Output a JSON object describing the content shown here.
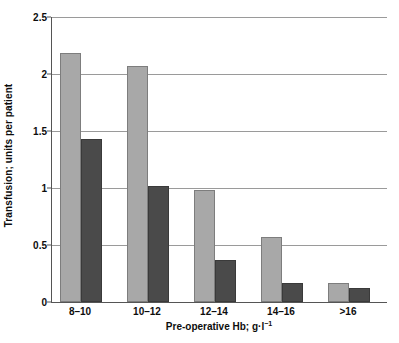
{
  "chart_data": {
    "type": "bar",
    "title": "",
    "subtitle": "",
    "xlabel": "Pre-operative Hb; g·l⁻¹",
    "ylabel": "Transfusion; units per patient",
    "categories": [
      "8–10",
      "10–12",
      "12–14",
      "14–16",
      ">16"
    ],
    "series": [
      {
        "name": "light-grey-series",
        "color": "#a8a8a8",
        "values": [
          2.18,
          2.07,
          0.98,
          0.57,
          0.17
        ]
      },
      {
        "name": "dark-grey-series",
        "color": "#4a4a4a",
        "values": [
          1.43,
          1.02,
          0.37,
          0.17,
          0.12
        ]
      }
    ],
    "ylim": [
      0,
      2.5
    ],
    "yticks": [
      "0",
      "0.5",
      "1",
      "1.5",
      "2",
      "2.5"
    ],
    "ytick_values": [
      0,
      0.5,
      1,
      1.5,
      2,
      2.5
    ],
    "grid": "horizontal",
    "legend": "none",
    "legend_position": "none",
    "axis_color": "#555555",
    "gridline_color": "#9a9a9a",
    "background": "#ffffff"
  }
}
